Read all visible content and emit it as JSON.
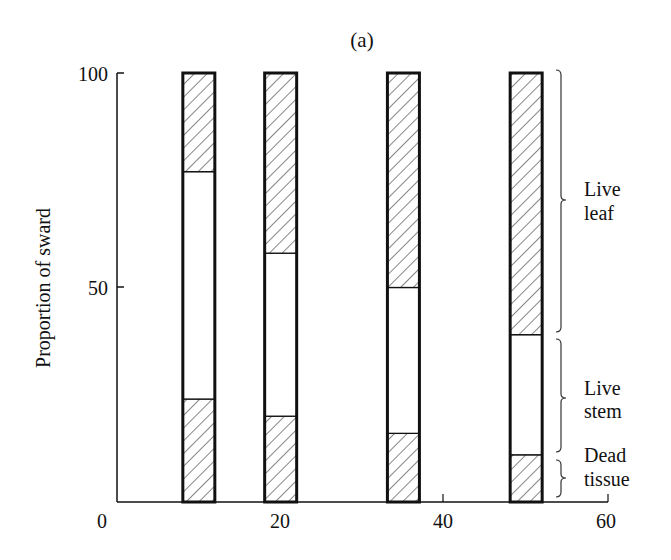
{
  "chart_data": {
    "type": "bar",
    "stacked": true,
    "title": "(a)",
    "xlabel": "",
    "ylabel": "Proportion of sward",
    "xlim": [
      0,
      60
    ],
    "ylim": [
      0,
      100
    ],
    "xticks": [
      0,
      20,
      40,
      60
    ],
    "yticks": [
      50,
      100
    ],
    "ytick_labels": [
      "50",
      "100"
    ],
    "xtick_labels": [
      "0",
      "20",
      "40",
      "60"
    ],
    "grid": false,
    "x": [
      10,
      20,
      35,
      50
    ],
    "series": [
      {
        "name": "Dead tissue",
        "pattern": "hatched",
        "values": [
          24,
          20,
          16,
          11
        ]
      },
      {
        "name": "Live stem",
        "pattern": "white",
        "values": [
          53,
          38,
          34,
          28
        ]
      },
      {
        "name": "Live leaf",
        "pattern": "hatched",
        "values": [
          23,
          42,
          50,
          61
        ]
      }
    ],
    "legend": {
      "position": "right (braces beside last bar)",
      "entries": [
        {
          "label_line1": "Live",
          "label_line2": "leaf"
        },
        {
          "label_line1": "Live",
          "label_line2": "stem"
        },
        {
          "label_line1": "Dead",
          "label_line2": "tissue"
        }
      ]
    }
  },
  "colors": {
    "ink": "#111111",
    "background": "#ffffff"
  }
}
